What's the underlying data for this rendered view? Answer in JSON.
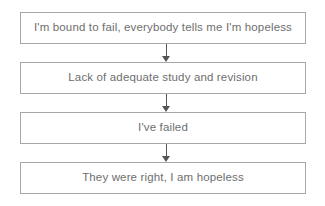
{
  "diagram": {
    "type": "vertical-flowchart",
    "background_color": "#ffffff",
    "box_border_color": "#a8a8a8",
    "text_color": "#6e6e6e",
    "arrow_color": "#555555",
    "nodes": [
      {
        "id": "node-1",
        "label": "I'm bound to fail, everybody tells me I'm hopeless"
      },
      {
        "id": "node-2",
        "label": "Lack of adequate study and revision"
      },
      {
        "id": "node-3",
        "label": "I've failed"
      },
      {
        "id": "node-4",
        "label": "They were right, I am hopeless"
      }
    ],
    "connectors": [
      {
        "id": "connector-1",
        "icon": "arrow-down-icon",
        "from": "node-1",
        "to": "node-2"
      },
      {
        "id": "connector-2",
        "icon": "arrow-down-icon",
        "from": "node-2",
        "to": "node-3"
      },
      {
        "id": "connector-3",
        "icon": "arrow-down-icon",
        "from": "node-3",
        "to": "node-4"
      }
    ]
  }
}
